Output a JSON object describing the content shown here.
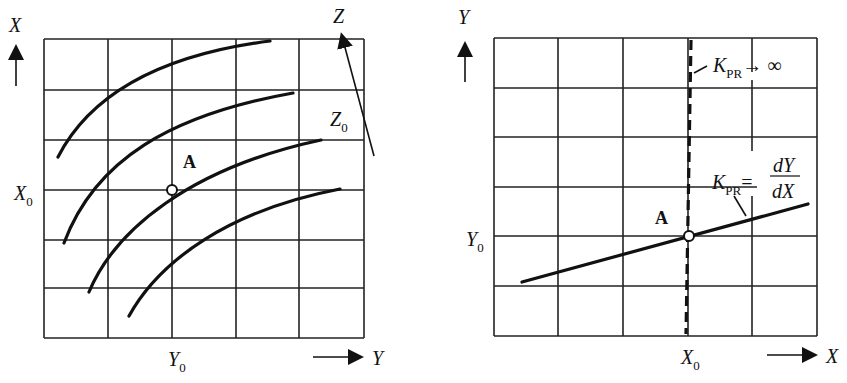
{
  "left_panel": {
    "axis_x_label": "X",
    "axis_y_label": "Y",
    "x0_label": "X",
    "x0_sub": "0",
    "y0_label": "Y",
    "y0_sub": "0",
    "z_label": "Z",
    "z0_label": "Z",
    "z0_sub": "0",
    "point_label": "A",
    "grid": {
      "cols": 5,
      "rows": 6
    },
    "curves_count": 4
  },
  "right_panel": {
    "axis_y_label": "Y",
    "axis_x_label": "X",
    "y0_label": "Y",
    "y0_sub": "0",
    "x0_label": "X",
    "x0_sub": "0",
    "point_label": "A",
    "k_inf_label": "K",
    "k_inf_sub": "PR",
    "k_inf_tail": "→ ∞",
    "k_slope_label": "K",
    "k_slope_sub": "PR",
    "k_slope_eq": "=",
    "k_slope_num": "dY",
    "k_slope_den": "dX",
    "grid": {
      "cols": 5,
      "rows": 6
    }
  }
}
